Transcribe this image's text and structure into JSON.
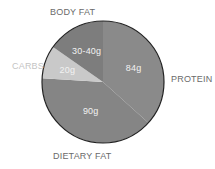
{
  "chart_data": {
    "type": "pie",
    "title": "",
    "start": "top",
    "direction": "clockwise",
    "slices": [
      {
        "name": "PROTEIN",
        "value": 84,
        "label": "84g",
        "color": "#8a8a8a",
        "label_color": "#6a6a6a"
      },
      {
        "name": "DIETARY FAT",
        "value": 90,
        "label": "90g",
        "color": "#858585",
        "label_color": "#6a6a6a"
      },
      {
        "name": "CARBS",
        "value": 20,
        "label": "20g",
        "color": "#c9c9c9",
        "label_color": "#c4c4c4"
      },
      {
        "name": "BODY FAT",
        "value": 35,
        "label": "30-40g",
        "color": "#7d7d7d",
        "label_color": "#6a6a6a"
      }
    ],
    "outline_color": "#222222"
  }
}
